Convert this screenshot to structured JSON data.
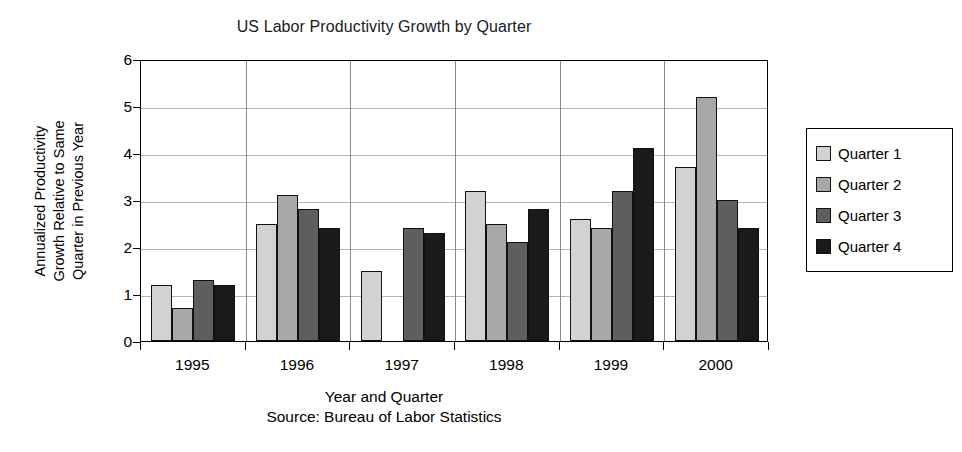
{
  "chart_data": {
    "type": "bar",
    "title": "US Labor Productivity Growth by Quarter",
    "xlabel": "Year and Quarter",
    "ylabel": "Annualized Productivity Growth Relative to Same Quarter in Previous Year",
    "ylabel_lines": [
      "Annualized Productivity",
      "Growth Relative to Same",
      "Quarter in Previous Year"
    ],
    "source": "Source: Bureau of Labor Statistics",
    "categories": [
      "1995",
      "1996",
      "1997",
      "1998",
      "1999",
      "2000"
    ],
    "series": [
      {
        "name": "Quarter 1",
        "color": "#d2d2d2",
        "values": [
          1.2,
          2.5,
          1.5,
          3.2,
          2.6,
          3.7
        ]
      },
      {
        "name": "Quarter 2",
        "color": "#a8a8a8",
        "values": [
          0.7,
          3.1,
          null,
          2.5,
          2.4,
          5.2
        ]
      },
      {
        "name": "Quarter 3",
        "color": "#5e5e5e",
        "values": [
          1.3,
          2.8,
          2.4,
          2.1,
          3.2,
          3.0
        ]
      },
      {
        "name": "Quarter 4",
        "color": "#1a1a1a",
        "values": [
          1.2,
          2.4,
          2.3,
          2.8,
          4.1,
          2.4
        ]
      }
    ],
    "ylim": [
      0,
      6
    ],
    "yticks": [
      0,
      1,
      2,
      3,
      4,
      5,
      6
    ],
    "ytick_labels": [
      "0",
      "1",
      "2",
      "3",
      "4",
      "5",
      "6"
    ],
    "grid": true,
    "legend_position": "right"
  },
  "legend": {
    "items": [
      {
        "label": "Quarter 1"
      },
      {
        "label": "Quarter 2"
      },
      {
        "label": "Quarter 3"
      },
      {
        "label": "Quarter 4"
      }
    ]
  }
}
